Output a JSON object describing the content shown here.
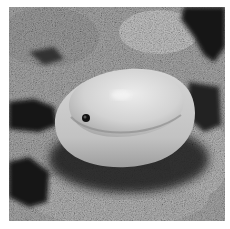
{
  "image": {
    "alt": "Grayscale photograph of a smooth, egg-shaped cowrie shell resting on rough rock",
    "subject": "cowrie shell",
    "background": "textured rock with dark crevices",
    "tone": "grayscale",
    "colors": {
      "border": "#ffffff",
      "rock_light": "#b8b8b8",
      "rock_mid": "#8a8a8a",
      "rock_dark": "#1a1a1a",
      "shell_light": "#e4e4e4",
      "shell_mid": "#c4c4c4",
      "shell_shadow": "#9a9a9a",
      "hole": "#111111"
    }
  }
}
